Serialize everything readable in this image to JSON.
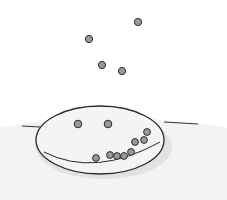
{
  "illustration": {
    "subject": "plate with pea smiley face and falling peas",
    "colors": {
      "background": "#ffffff",
      "table_shadow": "#ececec",
      "plate_fill": "#f2f2f2",
      "outline": "#2a2a2a",
      "pea_fill": "#9a9a9a"
    },
    "falling_peas": [
      {
        "cx": 138,
        "cy": 22
      },
      {
        "cx": 89,
        "cy": 39
      },
      {
        "cx": 102,
        "cy": 65
      },
      {
        "cx": 122,
        "cy": 71
      }
    ],
    "eye_peas": [
      {
        "cx": 78,
        "cy": 124
      },
      {
        "cx": 108,
        "cy": 124
      }
    ],
    "smile_peas": [
      {
        "cx": 96,
        "cy": 158
      },
      {
        "cx": 110,
        "cy": 155
      },
      {
        "cx": 117,
        "cy": 156
      },
      {
        "cx": 124,
        "cy": 156
      },
      {
        "cx": 131,
        "cy": 152
      },
      {
        "cx": 135,
        "cy": 142
      },
      {
        "cx": 144,
        "cy": 140
      },
      {
        "cx": 147,
        "cy": 132
      }
    ]
  }
}
